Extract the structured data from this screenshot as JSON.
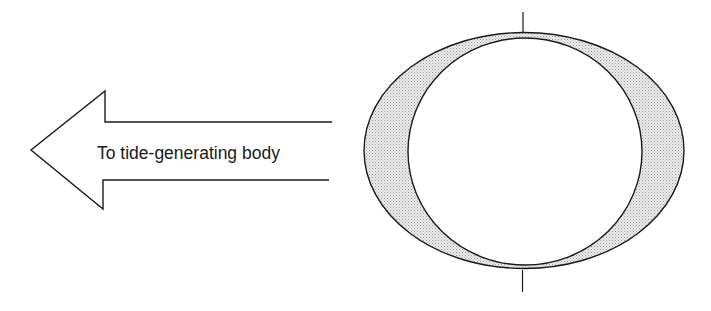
{
  "diagram": {
    "arrow": {
      "label": "To tide-generating body",
      "direction": "left"
    },
    "earth": {
      "outer_shape": "tidal-bulge-ellipse",
      "inner_shape": "solid-earth-circle",
      "shading": "stippled-gray",
      "axis": "vertical-rotation-axis"
    },
    "colors": {
      "stroke": "#1a1a1a",
      "bulge_fill": "#d6d6d6",
      "background": "#ffffff"
    }
  }
}
